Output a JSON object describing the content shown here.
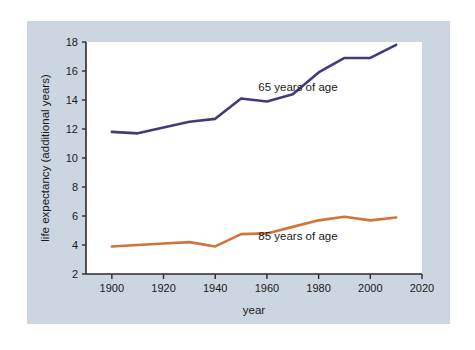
{
  "figure": {
    "panel_background": "#ccd6e0",
    "plot_background": "#ffffff",
    "outer_background": "#ffffff"
  },
  "chart_data": {
    "type": "line",
    "title": "",
    "subtitle": "",
    "xlabel": "year",
    "ylabel": "life expectancy (additional years)",
    "xlim": [
      1890,
      2020
    ],
    "ylim": [
      2,
      18
    ],
    "xticks": [
      1900,
      1920,
      1940,
      1960,
      1980,
      2000,
      2020
    ],
    "xtick_labels": [
      "1900",
      "1920",
      "1940",
      "1960",
      "1980",
      "2000",
      "2020"
    ],
    "yticks": [
      2,
      4,
      6,
      8,
      10,
      12,
      14,
      16,
      18
    ],
    "ytick_labels": [
      "2",
      "4",
      "6",
      "8",
      "10",
      "12",
      "14",
      "16",
      "18"
    ],
    "grid": false,
    "legend_position": "inline-annotation",
    "x": [
      1900,
      1910,
      1920,
      1930,
      1940,
      1950,
      1960,
      1970,
      1980,
      1990,
      2000,
      2010
    ],
    "series": [
      {
        "name": "65 years of age",
        "color": "#3f3c7c",
        "annotation": "65 years of age",
        "annotation_x": 1972,
        "annotation_y": 14.6,
        "values": [
          11.8,
          11.7,
          12.1,
          12.5,
          12.7,
          14.1,
          13.9,
          14.4,
          15.9,
          16.9,
          16.9,
          17.8
        ]
      },
      {
        "name": "85 years of age",
        "color": "#d2733a",
        "annotation": "85 years of age",
        "annotation_x": 1972,
        "annotation_y": 4.35,
        "values": [
          3.9,
          4.0,
          4.1,
          4.2,
          3.9,
          4.75,
          4.8,
          5.25,
          5.7,
          5.95,
          5.7,
          5.9
        ]
      }
    ]
  }
}
